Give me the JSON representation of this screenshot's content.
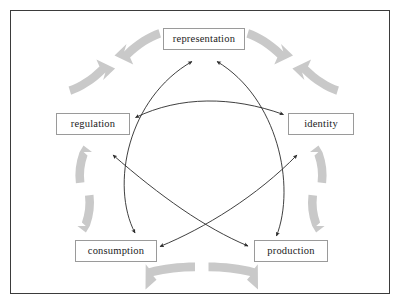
{
  "diagram": {
    "type": "cycle-diagram",
    "frame": {
      "border_color": "#3b3b3b"
    },
    "colors": {
      "node_border": "#9a9a9a",
      "node_fill": "#ffffff",
      "node_text": "#1b1b1b",
      "outer_arrow": "#c9c9c9",
      "inner_arrow": "#2a2a2a",
      "frame_border": "#3b3b3b",
      "background": "#ffffff"
    },
    "nodes": [
      {
        "id": "representation",
        "label": "representation",
        "x": 163,
        "y": 28,
        "w": 82,
        "h": 22,
        "cx": 204,
        "cy": 39
      },
      {
        "id": "identity",
        "label": "identity",
        "x": 288,
        "y": 113,
        "w": 66,
        "h": 22,
        "cx": 321,
        "cy": 124
      },
      {
        "id": "production",
        "label": "production",
        "x": 254,
        "y": 240,
        "w": 74,
        "h": 22,
        "cx": 291,
        "cy": 251
      },
      {
        "id": "consumption",
        "label": "consumption",
        "x": 75,
        "y": 240,
        "w": 82,
        "h": 22,
        "cx": 116,
        "cy": 251
      },
      {
        "id": "regulation",
        "label": "regulation",
        "x": 56,
        "y": 113,
        "w": 74,
        "h": 22,
        "cx": 93,
        "cy": 124
      }
    ],
    "outer_arrows": [
      {
        "from": "regulation",
        "to": "representation",
        "style": "thick-gray",
        "double_headed": true
      },
      {
        "from": "representation",
        "to": "identity",
        "style": "thick-gray",
        "double_headed": true
      },
      {
        "from": "identity",
        "to": "production",
        "style": "thick-gray",
        "double_headed": true
      },
      {
        "from": "production",
        "to": "consumption",
        "style": "thick-gray",
        "double_headed": true
      },
      {
        "from": "consumption",
        "to": "regulation",
        "style": "thick-gray",
        "double_headed": true
      }
    ],
    "inner_arrows": [
      {
        "from": "regulation",
        "to": "identity",
        "style": "thin-black",
        "double_headed": true
      },
      {
        "from": "consumption",
        "to": "representation",
        "style": "thin-black",
        "double_headed": true
      },
      {
        "from": "production",
        "to": "representation",
        "style": "thin-black",
        "double_headed": true
      },
      {
        "from": "regulation",
        "to": "production",
        "style": "thin-black",
        "double_headed": true
      },
      {
        "from": "consumption",
        "to": "identity",
        "style": "thin-black",
        "double_headed": true
      }
    ]
  }
}
